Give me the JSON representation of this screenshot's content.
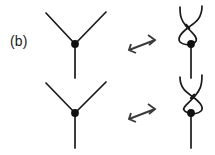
{
  "figure": {
    "panel_label": "(b)",
    "type": "knot-theory-diagram",
    "colors": {
      "stroke": "#1a1a1a",
      "node": "#111111",
      "arrow": "#3a3a3a",
      "background": "#ffffff"
    },
    "stroke_width": 1.7,
    "node_radius": 3.8,
    "rows": [
      {
        "id": "row-top",
        "left": {
          "name": "y-vertex-up",
          "node": {
            "x": 75,
            "y": 44
          },
          "legs": [
            {
              "name": "upper-left-leg",
              "x": 46,
              "y": 13
            },
            {
              "name": "upper-right-leg",
              "x": 106,
              "y": 12
            },
            {
              "name": "lower-stem",
              "x": 75,
              "y": 78
            }
          ]
        },
        "relation": {
          "name": "rightleftharpoons",
          "symbol": "rightleftharpoons",
          "x": 142,
          "y": 46
        },
        "right": {
          "name": "braided-vertex-up",
          "node": {
            "x": 191,
            "y": 44
          },
          "legs": [
            {
              "name": "upper-left-strand",
              "x": 180,
              "y": 7
            },
            {
              "name": "upper-right-strand",
              "x": 202,
              "y": 6
            },
            {
              "name": "lower-stem",
              "x": 191,
              "y": 78
            }
          ],
          "crossing": "over-under-braid"
        }
      },
      {
        "id": "row-bottom",
        "left": {
          "name": "y-vertex-down",
          "node": {
            "x": 75,
            "y": 113
          },
          "legs": [
            {
              "name": "upper-left-leg",
              "x": 46,
              "y": 83
            },
            {
              "name": "upper-right-leg",
              "x": 106,
              "y": 82
            },
            {
              "name": "lower-stem",
              "x": 75,
              "y": 148
            }
          ]
        },
        "relation": {
          "name": "rightleftharpoons",
          "symbol": "rightleftharpoons",
          "x": 142,
          "y": 115
        },
        "right": {
          "name": "braided-vertex-down",
          "node": {
            "x": 191,
            "y": 113
          },
          "legs": [
            {
              "name": "upper-left-strand",
              "x": 180,
              "y": 77
            },
            {
              "name": "upper-right-strand",
              "x": 202,
              "y": 75
            },
            {
              "name": "lower-stem",
              "x": 191,
              "y": 148
            }
          ],
          "crossing": "under-over-braid"
        }
      }
    ]
  }
}
